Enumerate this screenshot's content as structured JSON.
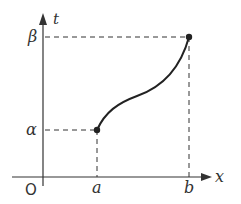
{
  "diagram": {
    "type": "function-graph",
    "axes": {
      "x_label": "x",
      "y_label": "t",
      "origin_label": "O"
    },
    "x_ticks": [
      {
        "label": "a"
      },
      {
        "label": "b"
      }
    ],
    "y_ticks": [
      {
        "label": "α"
      },
      {
        "label": "β"
      }
    ],
    "curve": {
      "start": {
        "x": "a",
        "y": "α"
      },
      "end": {
        "x": "b",
        "y": "β"
      },
      "shape": "increasing S-curve"
    },
    "colors": {
      "ink": "#333333",
      "curve": "#222222"
    }
  }
}
